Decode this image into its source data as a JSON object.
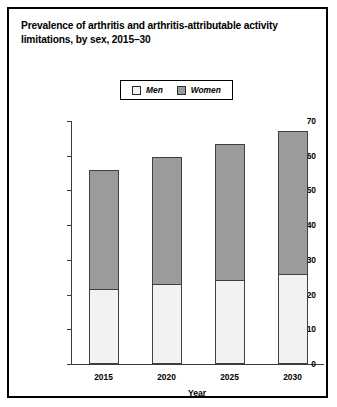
{
  "figure": {
    "title": "Prevalence of arthritis and arthritis-attributable activity limitations, by sex, 2015–30"
  },
  "legend": {
    "position": "top-center",
    "entries": [
      {
        "label": "Men",
        "color": "#f2f2f0",
        "icon": "legend-swatch-icon"
      },
      {
        "label": "Women",
        "color": "#9b9b9b",
        "icon": "legend-swatch-icon"
      }
    ]
  },
  "chart_data": {
    "type": "bar",
    "stacked": true,
    "title": "Prevalence of arthritis and arthritis-attributable activity limitations, by sex, 2015–30",
    "xlabel": "Year",
    "ylabel": "Projected number of adults with arthritis (in millions)",
    "categories": [
      "2015",
      "2020",
      "2025",
      "2030"
    ],
    "yticks": [
      "0",
      "10",
      "20",
      "30",
      "40",
      "50",
      "60",
      "70"
    ],
    "ylim": [
      0,
      70
    ],
    "ytick_step": 10,
    "grid": false,
    "series": [
      {
        "name": "Men",
        "color": "#f2f2f0",
        "values": [
          21.6,
          23.0,
          24.3,
          26.0
        ]
      },
      {
        "name": "Women",
        "color": "#9b9b9b",
        "values": [
          34.4,
          36.6,
          39.1,
          41.0
        ]
      }
    ],
    "totals": [
      56.0,
      59.6,
      63.4,
      67.0
    ]
  }
}
